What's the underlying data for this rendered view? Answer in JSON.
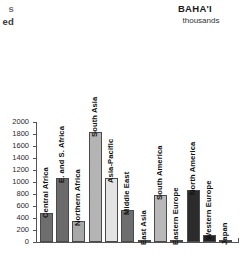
{
  "page": {
    "clipped_left_text": {
      "line1": "s",
      "line2": "ed"
    },
    "title": "BAHA'I",
    "subtitle": "thousands"
  },
  "chart_data": {
    "type": "bar",
    "title": "BAHA'I",
    "subtitle": "thousands",
    "xlabel": "",
    "ylabel": "",
    "ylim": [
      0,
      2000
    ],
    "grid": false,
    "legend": "none",
    "yticks": [
      0,
      200,
      400,
      600,
      800,
      1000,
      1200,
      1400,
      1600,
      1800,
      2000
    ],
    "ytick_labels": [
      "0",
      "200",
      "400",
      "600",
      "800",
      "1000",
      "1200",
      "1400",
      "1600",
      "1800",
      "2000"
    ],
    "categories": [
      "Central Africa",
      "E. and S. Africa",
      "Northern Africa",
      "South Asia",
      "Asia-Pacific",
      "Middle East",
      "East Asia",
      "South America",
      "Eastern Europe",
      "North America",
      "Western Europe",
      "Japan"
    ],
    "values": [
      490,
      1075,
      345,
      1835,
      1065,
      540,
      40,
      790,
      30,
      865,
      115,
      15
    ],
    "bar_colors": [
      "#6e6e6e",
      "#6b6b6b",
      "#a8a8a8",
      "#b4b4b4",
      "#e3e3e3",
      "#6e6e6e",
      "#efefef",
      "#b8b8b8",
      "#8a8a8a",
      "#2b2b2b",
      "#232323",
      "#cfcfcf"
    ]
  }
}
